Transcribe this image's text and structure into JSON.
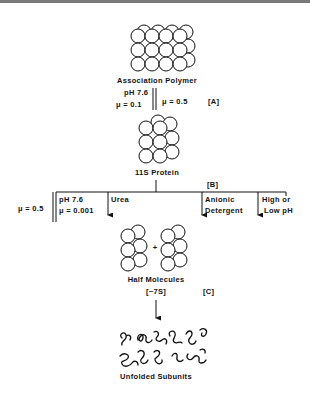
{
  "diagram": {
    "stages": {
      "association_polymer": {
        "label": "Association Polymer"
      },
      "protein_11s": {
        "label": "11S Protein",
        "tag": "[B]"
      },
      "half_molecules": {
        "label": "Half Molecules",
        "sublabel": "[~7S]",
        "tag": "[C]"
      },
      "unfolded_subunits": {
        "label": "Unfolded Subunits"
      }
    },
    "transition_a": {
      "left_line1": "pH  7.6",
      "left_line2": "μ = 0.1",
      "right": "μ = 0.5",
      "tag": "[A]"
    },
    "transition_b": {
      "reverse_condition": "μ = 0.5",
      "branches": [
        {
          "line1": "pH  7.6",
          "line2": "μ = 0.001"
        },
        {
          "line1": "Urea",
          "line2": ""
        },
        {
          "line1": "Anionic",
          "line2": "Detergent"
        },
        {
          "line1": "High or",
          "line2": "Low pH"
        }
      ]
    },
    "plus_sign": "+",
    "colors": {
      "ink": "#111111",
      "paper": "#ffffff",
      "border": "#7a7a7a"
    }
  }
}
